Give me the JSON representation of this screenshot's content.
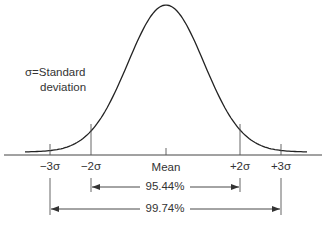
{
  "chart_data": {
    "type": "line",
    "annotation": "σ=Standard deviation",
    "annotation_lines": [
      "σ=Standard",
      "deviation"
    ],
    "x_ticks": [
      {
        "label": "−3σ",
        "value": -3
      },
      {
        "label": "−2σ",
        "value": -2
      },
      {
        "label": "Mean",
        "value": 0
      },
      {
        "label": "+2σ",
        "value": 2
      },
      {
        "label": "+3σ",
        "value": 3
      }
    ],
    "ranges": [
      {
        "from": -2,
        "to": 2,
        "label": "95.44%"
      },
      {
        "from": -3,
        "to": 3,
        "label": "99.74%"
      }
    ],
    "curve": "gaussian",
    "xlim": [
      -3.6,
      3.6
    ]
  },
  "labels": {
    "sigma_line1": "σ=Standard",
    "sigma_line2": "deviation",
    "tick_m3": "−3σ",
    "tick_m2": "−2σ",
    "tick_mean": "Mean",
    "tick_p2": "+2σ",
    "tick_p3": "+3σ",
    "range_2sigma": "95.44%",
    "range_3sigma": "99.74%"
  }
}
